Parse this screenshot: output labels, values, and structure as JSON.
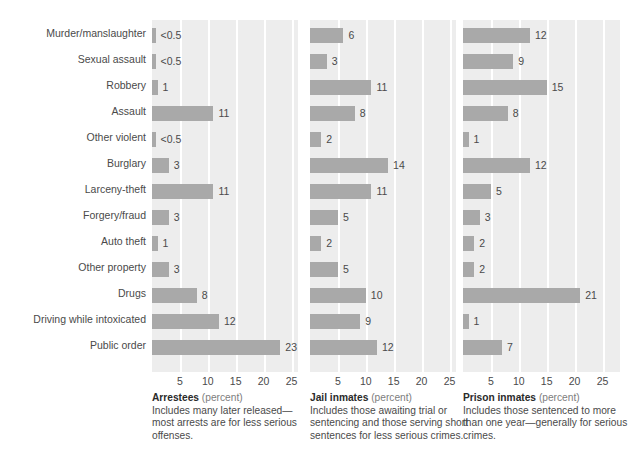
{
  "chart_data": {
    "type": "bar",
    "title": "",
    "orientation": "horizontal",
    "grid": true,
    "legend_position": "none",
    "xlabel": "",
    "ylabel": "",
    "xlim": [
      0,
      27
    ],
    "xticks": [
      5,
      10,
      15,
      20,
      25
    ],
    "categories": [
      "Murder/manslaughter",
      "Sexual assault",
      "Robbery",
      "Assault",
      "Other violent",
      "Burglary",
      "Larceny-theft",
      "Forgery/fraud",
      "Auto theft",
      "Other property",
      "Drugs",
      "Driving while intoxicated",
      "Public order"
    ],
    "series": [
      {
        "name": "Arrestees",
        "unit": "(percent)",
        "values": [
          0.3,
          0.3,
          1,
          11,
          0.3,
          3,
          11,
          3,
          1,
          3,
          8,
          12,
          23
        ],
        "labels": [
          "<0.5",
          "<0.5",
          "1",
          "11",
          "<0.5",
          "3",
          "11",
          "3",
          "1",
          "3",
          "8",
          "12",
          "23"
        ],
        "note": "Includes many later released—most arrests are for less serious offenses."
      },
      {
        "name": "Jail inmates",
        "unit": "(percent)",
        "values": [
          6,
          3,
          11,
          8,
          2,
          14,
          11,
          5,
          2,
          5,
          10,
          9,
          12
        ],
        "labels": [
          "6",
          "3",
          "11",
          "8",
          "2",
          "14",
          "11",
          "5",
          "2",
          "5",
          "10",
          "9",
          "12"
        ],
        "note": "Includes those awaiting trial or sentencing and those serving short sentences for less serious crimes."
      },
      {
        "name": "Prison inmates",
        "unit": "(percent)",
        "values": [
          12,
          9,
          15,
          8,
          1,
          12,
          5,
          3,
          2,
          2,
          21,
          1,
          7
        ],
        "labels": [
          "12",
          "9",
          "15",
          "8",
          "1",
          "12",
          "5",
          "3",
          "2",
          "2",
          "21",
          "1",
          "7"
        ],
        "note": "Includes those sentenced to more than one year—generally for serious crimes."
      }
    ],
    "colors": {
      "bar": "#a9a9a9",
      "panel_background": "#ededed",
      "gridline": "#ffffff",
      "text": "#4a4a4a",
      "page_background": "#ffffff"
    }
  }
}
